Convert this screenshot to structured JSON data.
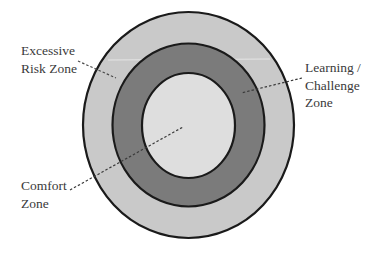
{
  "diagram": {
    "type": "concentric-zones",
    "center": {
      "x": 188.5,
      "y": 125
    },
    "zones": [
      {
        "id": "excessive-risk",
        "name": "Excessive Risk Zone",
        "label_lines": [
          "Excessive",
          "Risk Zone"
        ],
        "rx": 105.5,
        "ry": 113,
        "fill": "#c9c9c9"
      },
      {
        "id": "learning-challenge",
        "name": "Learning / Challenge Zone",
        "label_lines": [
          "Learning /",
          "Challenge",
          "Zone"
        ],
        "rx": 76,
        "ry": 81.5,
        "fill": "#7b7b7b"
      },
      {
        "id": "comfort",
        "name": "Comfort Zone",
        "label_lines": [
          "Comfort",
          "Zone"
        ],
        "rx": 46.5,
        "ry": 52.5,
        "fill": "#dedede"
      }
    ],
    "stroke_color": "#1a1a1a",
    "leader_line_color": "#4a4a4a",
    "leaders": [
      {
        "zone": "excessive-risk",
        "x1": 78,
        "y1": 61,
        "x2": 116,
        "y2": 78
      },
      {
        "zone": "learning-challenge",
        "x1": 302,
        "y1": 78,
        "x2": 241,
        "y2": 93
      },
      {
        "zone": "comfort",
        "x1": 70,
        "y1": 190,
        "x2": 183,
        "y2": 127
      }
    ]
  }
}
